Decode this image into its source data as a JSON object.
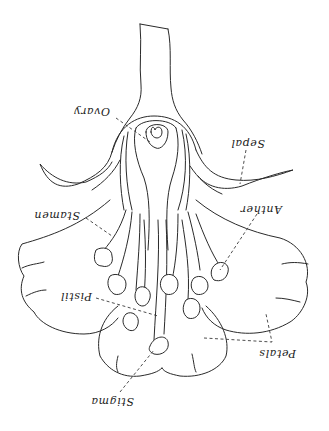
{
  "diagram": {
    "title": "",
    "orientation": "rotated 180 degrees (upside down)",
    "labels": [
      {
        "id": "ovary",
        "text": "Ovary"
      },
      {
        "id": "sepal",
        "text": "Sepal"
      },
      {
        "id": "anther",
        "text": "Anther"
      },
      {
        "id": "stamen",
        "text": "Stamen"
      },
      {
        "id": "pistil",
        "text": "Pistil"
      },
      {
        "id": "petals",
        "text": "Petals"
      },
      {
        "id": "stigma",
        "text": "Stigma"
      }
    ],
    "colors": {
      "line": "#2a2a2a",
      "background": "#ffffff"
    }
  }
}
